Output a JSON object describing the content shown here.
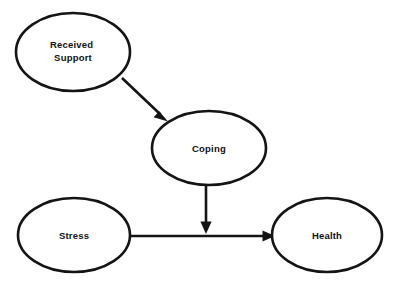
{
  "diagram": {
    "type": "path-diagram",
    "background_color": "#ffffff",
    "stroke_color": "#141414",
    "text_color": "#111111",
    "nodes": [
      {
        "id": "received-support",
        "label": "Received Support",
        "label_line_1": "Received",
        "label_line_2": "Support",
        "shape": "ellipse",
        "cx": 73,
        "cy": 52,
        "rx": 57,
        "ry": 39
      },
      {
        "id": "coping",
        "label": "Coping",
        "label_line_1": "Coping",
        "label_line_2": "",
        "shape": "ellipse",
        "cx": 209,
        "cy": 148,
        "rx": 57,
        "ry": 37
      },
      {
        "id": "stress",
        "label": "Stress",
        "label_line_1": "Stress",
        "label_line_2": "",
        "shape": "ellipse",
        "cx": 74,
        "cy": 235,
        "rx": 56,
        "ry": 37
      },
      {
        "id": "health",
        "label": "Health",
        "label_line_1": "Health",
        "label_line_2": "",
        "shape": "ellipse",
        "cx": 327,
        "cy": 235,
        "rx": 55,
        "ry": 37
      }
    ],
    "edges": [
      {
        "id": "support-to-coping",
        "from": "received-support",
        "to": "coping",
        "label": "",
        "direction": "diagonal-down-right",
        "x1": 122,
        "y1": 78,
        "x2": 167,
        "y2": 121
      },
      {
        "id": "coping-to-stress-health",
        "from": "coping",
        "to": "stress-health-path",
        "label": "",
        "direction": "vertical-down",
        "x1": 206,
        "y1": 186,
        "x2": 206,
        "y2": 233
      },
      {
        "id": "stress-to-health",
        "from": "stress",
        "to": "health",
        "label": "",
        "direction": "horizontal-right",
        "x1": 130,
        "y1": 236,
        "x2": 274,
        "y2": 236
      }
    ]
  }
}
